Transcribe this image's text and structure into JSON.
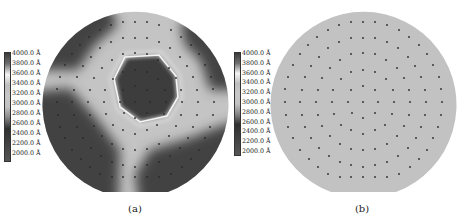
{
  "figure": {
    "colorbar_labels": [
      "4000.0 Å",
      "3800.0 Å",
      "3600.0 Å",
      "3400.0 Å",
      "3200.0 Å",
      "3000.0 Å",
      "2800.0 Å",
      "2600.0 Å",
      "2400.0 Å",
      "2200.0 Å",
      "2000.0 Å"
    ],
    "colorbar_colors": [
      "#3a3a3a",
      "#6e6e6e",
      "#f4f4f4",
      "#bdbdbd",
      "#c8c8c8",
      "#c2c2c2",
      "#858585",
      "#303030",
      "#3d3d3d",
      "#4a4a4a",
      "#545454"
    ],
    "panels": [
      {
        "id": "a",
        "caption": "(a)",
        "description": "Thickness map with non-uniform regions"
      },
      {
        "id": "b",
        "caption": "(b)",
        "description": "Uniform thickness map"
      }
    ],
    "colors": {
      "uniform_fill": "#c2c2c2",
      "dark_region": "#424242",
      "light_region": "#c4c4c4",
      "highlight_ring": "#f2f2f2",
      "dot": "#2a2a2a"
    },
    "measurement_points_offsets": [
      [
        -24,
        -77
      ],
      [
        -12,
        -80
      ],
      [
        0,
        -80
      ],
      [
        12,
        -80
      ],
      [
        24,
        -77
      ],
      [
        -35,
        -72
      ],
      [
        36,
        -72
      ],
      [
        -46,
        -65
      ],
      [
        -12,
        -64
      ],
      [
        0,
        -64
      ],
      [
        12,
        -64
      ],
      [
        46,
        -65
      ],
      [
        -24,
        -60
      ],
      [
        24,
        -60
      ],
      [
        -55,
        -57
      ],
      [
        -35,
        -54
      ],
      [
        35,
        -54
      ],
      [
        56,
        -57
      ],
      [
        -12,
        -48
      ],
      [
        0,
        -49
      ],
      [
        12,
        -48
      ],
      [
        -23,
        -42
      ],
      [
        23,
        -42
      ],
      [
        -44,
        -45
      ],
      [
        45,
        -45
      ],
      [
        -63,
        -48
      ],
      [
        64,
        -48
      ],
      [
        -33,
        -34
      ],
      [
        -12,
        -30
      ],
      [
        0,
        -32
      ],
      [
        12,
        -30
      ],
      [
        34,
        -34
      ],
      [
        -52,
        -36
      ],
      [
        52,
        -36
      ],
      [
        -70,
        -37
      ],
      [
        70,
        -37
      ],
      [
        -22,
        -23
      ],
      [
        23,
        -23
      ],
      [
        -41,
        -24
      ],
      [
        41,
        -24
      ],
      [
        -58,
        -25
      ],
      [
        58,
        -25
      ],
      [
        -75,
        -25
      ],
      [
        76,
        -25
      ],
      [
        0,
        -16
      ],
      [
        -12,
        -12
      ],
      [
        12,
        -12
      ],
      [
        -30,
        -12
      ],
      [
        30,
        -12
      ],
      [
        -45,
        -12
      ],
      [
        46,
        -12
      ],
      [
        -61,
        -12
      ],
      [
        62,
        -12
      ],
      [
        -78,
        -13
      ],
      [
        78,
        -13
      ],
      [
        -78,
        0
      ],
      [
        -63,
        0
      ],
      [
        -47,
        0
      ],
      [
        -31,
        0
      ],
      [
        -15,
        0
      ],
      [
        0,
        0
      ],
      [
        15,
        0
      ],
      [
        31,
        0
      ],
      [
        47,
        0
      ],
      [
        63,
        0
      ],
      [
        79,
        0
      ],
      [
        -77,
        13
      ],
      [
        -61,
        13
      ],
      [
        -45,
        13
      ],
      [
        -29,
        12
      ],
      [
        -11,
        11
      ],
      [
        0,
        16
      ],
      [
        12,
        11
      ],
      [
        29,
        12
      ],
      [
        46,
        13
      ],
      [
        62,
        13
      ],
      [
        78,
        13
      ],
      [
        -75,
        25
      ],
      [
        -58,
        25
      ],
      [
        -41,
        24
      ],
      [
        -22,
        23
      ],
      [
        22,
        23
      ],
      [
        41,
        24
      ],
      [
        58,
        25
      ],
      [
        75,
        25
      ],
      [
        -12,
        28
      ],
      [
        0,
        32
      ],
      [
        12,
        28
      ],
      [
        -70,
        36
      ],
      [
        -52,
        36
      ],
      [
        -33,
        34
      ],
      [
        34,
        34
      ],
      [
        53,
        36
      ],
      [
        70,
        36
      ],
      [
        -23,
        42
      ],
      [
        24,
        42
      ],
      [
        -12,
        47
      ],
      [
        0,
        48
      ],
      [
        12,
        47
      ],
      [
        -63,
        48
      ],
      [
        -44,
        46
      ],
      [
        45,
        46
      ],
      [
        64,
        48
      ],
      [
        -34,
        54
      ],
      [
        35,
        54
      ],
      [
        -54,
        57
      ],
      [
        56,
        57
      ],
      [
        -23,
        60
      ],
      [
        -12,
        63
      ],
      [
        0,
        65
      ],
      [
        12,
        63
      ],
      [
        24,
        60
      ],
      [
        -45,
        65
      ],
      [
        47,
        65
      ],
      [
        -35,
        72
      ],
      [
        36,
        72
      ],
      [
        -23,
        75
      ],
      [
        -12,
        75
      ],
      [
        0,
        75
      ],
      [
        12,
        75
      ],
      [
        24,
        75
      ]
    ]
  }
}
